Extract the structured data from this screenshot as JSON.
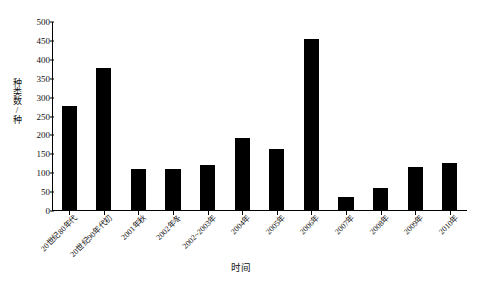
{
  "chart_data": {
    "type": "bar",
    "title": "",
    "xlabel": "时间",
    "ylabel": "种类数/种",
    "ylim": [
      0,
      500
    ],
    "ytick_values": [
      500,
      450,
      400,
      350,
      300,
      250,
      200,
      150,
      100,
      50,
      0
    ],
    "grid": false,
    "legend": "none",
    "bar_color": "#000000",
    "categories": [
      "20世纪80年代",
      "20世纪90年代初",
      "2001年秋",
      "2002年冬",
      "2002~2003年",
      "2004年",
      "2005年",
      "2006年",
      "2007年",
      "2008年",
      "2009年",
      "2010年"
    ],
    "values": [
      278,
      378,
      111,
      111,
      122,
      192,
      163,
      455,
      38,
      62,
      117,
      127
    ]
  },
  "axes": {
    "y_title": "种类数/种",
    "x_title": "时间"
  }
}
